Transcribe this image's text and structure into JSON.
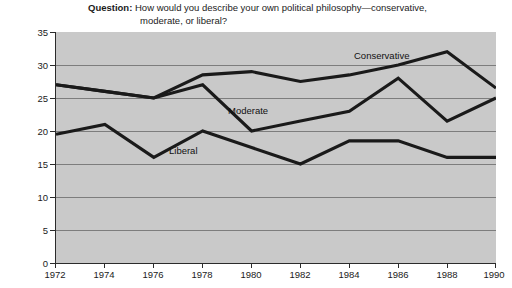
{
  "title": {
    "prefix": "Question:",
    "line1": " How would you describe your own political philosophy—conservative,",
    "line2": "moderate, or liberal?"
  },
  "axes": {
    "y_title": "Percentage",
    "y_ticks": [
      "35",
      "30",
      "25",
      "20",
      "15",
      "10",
      "5",
      "0"
    ],
    "x_ticks": [
      "1972",
      "1974",
      "1976",
      "1978",
      "1980",
      "1982",
      "1984",
      "1986",
      "1988",
      "1990"
    ]
  },
  "series_labels": {
    "conservative": "Conservative",
    "moderate": "Moderate",
    "liberal": "Liberal"
  },
  "colors": {
    "plot_background": "#c9c9c9",
    "line": "#1a1a1a",
    "gridline": "#7d7d7d",
    "axis": "#2b2b2b",
    "text": "#1b1b1b"
  },
  "chart_data": {
    "type": "line",
    "title": "Question: How would you describe your own political philosophy—conservative, moderate, or liberal?",
    "xlabel": "",
    "ylabel": "Percentage",
    "x": [
      1972,
      1974,
      1976,
      1978,
      1980,
      1982,
      1984,
      1986,
      1988,
      1990
    ],
    "categories": [
      "1972",
      "1974",
      "1976",
      "1978",
      "1980",
      "1982",
      "1984",
      "1986",
      "1988",
      "1990"
    ],
    "series": [
      {
        "name": "Conservative",
        "values": [
          27,
          26,
          25,
          28.5,
          29,
          27.5,
          28.5,
          30,
          32,
          26.5
        ]
      },
      {
        "name": "Moderate",
        "values": [
          27,
          26,
          25,
          27,
          20,
          21.5,
          23,
          28,
          21.5,
          25
        ]
      },
      {
        "name": "Liberal",
        "values": [
          19.5,
          21,
          16,
          20,
          17.5,
          15,
          18.5,
          18.5,
          16,
          16
        ]
      }
    ],
    "ylim": [
      0,
      35
    ],
    "ytick_step": 5,
    "xlim": [
      1972,
      1990
    ],
    "grid": true,
    "legend": "inline-labels"
  }
}
